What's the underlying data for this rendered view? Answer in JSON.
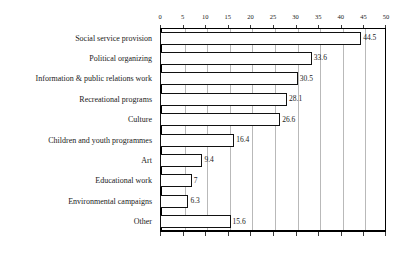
{
  "chart_data": {
    "type": "bar",
    "orientation": "horizontal",
    "title": "",
    "subtitle": "",
    "xlabel": "",
    "ylabel": "",
    "xlim": [
      0,
      50
    ],
    "xticks": [
      0,
      5,
      10,
      15,
      20,
      25,
      30,
      35,
      40,
      45,
      50
    ],
    "xtick_labels": [
      "0",
      "5",
      "10",
      "15",
      "20",
      "25",
      "30",
      "35",
      "40",
      "45",
      "50"
    ],
    "axis_position": "top",
    "grid": true,
    "grid_axis": "x",
    "legend": false,
    "bar_fill_color": "#ffffff",
    "bar_border_color": "#111111",
    "gridline_color": "#b9b9b9",
    "frame_color": "#000000",
    "categories": [
      "Social service provision",
      "Political organizing",
      "Information & public relations work",
      "Recreational programs",
      "Culture",
      "Children and youth programmes",
      "Art",
      "Educational work",
      "Environmental campaigns",
      "Other"
    ],
    "values": [
      44.5,
      33.6,
      30.5,
      28.1,
      26.6,
      16.4,
      9.4,
      7,
      6.3,
      15.6
    ],
    "value_labels": [
      "44.5",
      "33.6",
      "30.5",
      "28.1",
      "26.6",
      "16.4",
      "9.4",
      "7",
      "6.3",
      "15.6"
    ]
  }
}
